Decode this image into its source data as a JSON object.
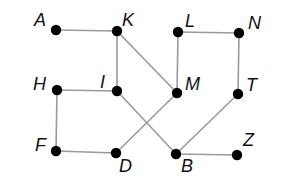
{
  "diagram": {
    "type": "graph",
    "node_color": "#000000",
    "edge_color": "#9a9a9a",
    "nodes": [
      {
        "id": "A",
        "label": "A",
        "x": 56,
        "y": 30,
        "lx": 34,
        "ly": 26
      },
      {
        "id": "K",
        "label": "K",
        "x": 117,
        "y": 31,
        "lx": 122,
        "ly": 26
      },
      {
        "id": "L",
        "label": "L",
        "x": 178,
        "y": 32,
        "lx": 185,
        "ly": 27
      },
      {
        "id": "N",
        "label": "N",
        "x": 239,
        "y": 33,
        "lx": 248,
        "ly": 29
      },
      {
        "id": "H",
        "label": "H",
        "x": 57,
        "y": 90,
        "lx": 33,
        "ly": 90
      },
      {
        "id": "I",
        "label": "I",
        "x": 117,
        "y": 91,
        "lx": 100,
        "ly": 88
      },
      {
        "id": "M",
        "label": "M",
        "x": 177,
        "y": 93,
        "lx": 185,
        "ly": 90
      },
      {
        "id": "T",
        "label": "T",
        "x": 238,
        "y": 94,
        "lx": 246,
        "ly": 91
      },
      {
        "id": "F",
        "label": "F",
        "x": 56,
        "y": 151,
        "lx": 35,
        "ly": 151
      },
      {
        "id": "D",
        "label": "D",
        "x": 116,
        "y": 153,
        "lx": 119,
        "ly": 172
      },
      {
        "id": "B",
        "label": "B",
        "x": 176,
        "y": 154,
        "lx": 181,
        "ly": 172
      },
      {
        "id": "Z",
        "label": "Z",
        "x": 237,
        "y": 155,
        "lx": 243,
        "ly": 146
      }
    ],
    "edges": [
      [
        "A",
        "K"
      ],
      [
        "K",
        "I"
      ],
      [
        "K",
        "M"
      ],
      [
        "L",
        "N"
      ],
      [
        "L",
        "M"
      ],
      [
        "N",
        "T"
      ],
      [
        "H",
        "I"
      ],
      [
        "H",
        "F"
      ],
      [
        "F",
        "D"
      ],
      [
        "I",
        "B"
      ],
      [
        "M",
        "D"
      ],
      [
        "T",
        "B"
      ],
      [
        "B",
        "Z"
      ]
    ]
  }
}
